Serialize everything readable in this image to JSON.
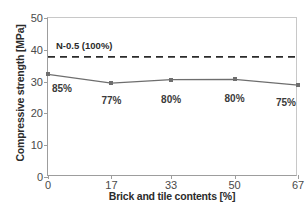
{
  "chart_data": {
    "type": "line",
    "title": "",
    "xlabel": "Brick and tile contents [%]",
    "ylabel": "Compressive strength [MPa]",
    "x": [
      0,
      17,
      33,
      50,
      67
    ],
    "xticklabels": [
      "0",
      "17",
      "33",
      "50",
      "67"
    ],
    "yticklabels": [
      "0",
      "10",
      "20",
      "30",
      "40",
      "50"
    ],
    "yticks": [
      0,
      10,
      20,
      30,
      40,
      50
    ],
    "xlim": [
      0,
      67
    ],
    "ylim": [
      0,
      50
    ],
    "grid": false,
    "legend": "none",
    "series": [
      {
        "name": "Compressive strength",
        "values": [
          32.3,
          29.5,
          30.6,
          30.7,
          28.9
        ],
        "point_labels": [
          "85%",
          "77%",
          "80%",
          "80%",
          "75%"
        ],
        "color": "#6e6e6e",
        "marker": "square"
      }
    ],
    "reference_line": {
      "label": "N-0.5 (100%)",
      "value": 37.8,
      "style": "dashed",
      "color": "#2b2b2b"
    }
  },
  "colors": {
    "line": "#6e6e6e",
    "axis": "#9d9d9d",
    "text": "#2b2b2b",
    "reference": "#2b2b2b"
  }
}
